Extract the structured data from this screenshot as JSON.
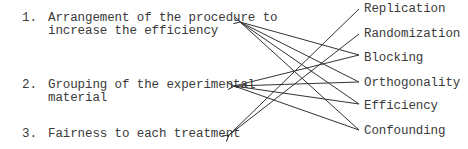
{
  "left_items": [
    {
      "number": "1.",
      "lines": [
        "Arrangement of the procedure to",
        "increase the efficiency"
      ]
    },
    {
      "number": "2.",
      "lines": [
        "Grouping of the experimental",
        "material"
      ]
    },
    {
      "number": "3.",
      "lines": [
        "Fairness to each treatment"
      ]
    }
  ],
  "right_terms": [
    "Replication",
    "Randomization",
    "Blocking",
    "Orthogonality",
    "Efficiency",
    "Confounding"
  ],
  "connections": [
    {
      "from_term": "Blocking",
      "to_item": 1
    },
    {
      "from_term": "Orthogonality",
      "to_item": 1
    },
    {
      "from_term": "Efficiency",
      "to_item": 1
    },
    {
      "from_term": "Confounding",
      "to_item": 1
    },
    {
      "from_term": "Blocking",
      "to_item": 2
    },
    {
      "from_term": "Orthogonality",
      "to_item": 2
    },
    {
      "from_term": "Efficiency",
      "to_item": 2
    },
    {
      "from_term": "Confounding",
      "to_item": 2
    },
    {
      "from_term": "Replication",
      "to_item": 3
    },
    {
      "from_term": "Randomization",
      "to_item": 3
    }
  ],
  "line_color": "#333333"
}
